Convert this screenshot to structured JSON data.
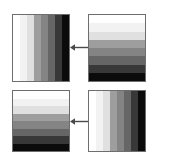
{
  "figure": {
    "background_color": "#ffffff",
    "border_color": "#6e6e6e",
    "arrow_color": "#4a4a4a",
    "layout": "2x2 grid of striped panels with leftward arrows between columns"
  },
  "chart_data": {
    "type": "heatmap",
    "xlabel": "",
    "ylabel": "",
    "grid": false,
    "legend": "none",
    "panels": [
      {
        "id": "top-left",
        "position": "top-left",
        "orientation": "vertical",
        "stripe_count": 8,
        "values": [
          100,
          95,
          88,
          62,
          52,
          40,
          22,
          4
        ],
        "colors": [
          "#ffffff",
          "#f2f2f2",
          "#e0e0e0",
          "#9e9e9e",
          "#848484",
          "#666666",
          "#383838",
          "#0b0b0b"
        ]
      },
      {
        "id": "top-right",
        "position": "top-right",
        "orientation": "horizontal",
        "stripe_count": 8,
        "values": [
          100,
          95,
          88,
          62,
          52,
          40,
          22,
          4
        ],
        "colors": [
          "#ffffff",
          "#f2f2f2",
          "#e0e0e0",
          "#9e9e9e",
          "#848484",
          "#666666",
          "#383838",
          "#0b0b0b"
        ]
      },
      {
        "id": "bottom-left",
        "position": "bottom-left",
        "orientation": "horizontal",
        "stripe_count": 8,
        "values": [
          100,
          95,
          88,
          62,
          52,
          40,
          22,
          4
        ],
        "colors": [
          "#ffffff",
          "#f2f2f2",
          "#e0e0e0",
          "#9e9e9e",
          "#848484",
          "#666666",
          "#383838",
          "#0b0b0b"
        ]
      },
      {
        "id": "bottom-right",
        "position": "bottom-right",
        "orientation": "vertical",
        "stripe_count": 8,
        "values": [
          100,
          95,
          88,
          62,
          52,
          40,
          22,
          4
        ],
        "colors": [
          "#ffffff",
          "#f2f2f2",
          "#e0e0e0",
          "#9e9e9e",
          "#848484",
          "#666666",
          "#383838",
          "#0b0b0b"
        ]
      }
    ],
    "arrows": [
      {
        "id": "top-arrow",
        "direction": "left",
        "from": "top-right",
        "to": "top-left"
      },
      {
        "id": "bottom-arrow",
        "direction": "left",
        "from": "bottom-right",
        "to": "bottom-left"
      }
    ]
  }
}
